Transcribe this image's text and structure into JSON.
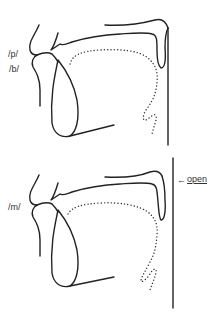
{
  "figure": {
    "type": "vocal tract sagittal sections",
    "panels": [
      {
        "id": "bilabial-oral",
        "labels": [
          "/p/",
          "/b/"
        ],
        "velum_state": "closed"
      },
      {
        "id": "bilabial-nasal",
        "labels": [
          "/m/"
        ],
        "velum_state": "open",
        "annotation": {
          "arrow": "←",
          "text": "open"
        }
      }
    ]
  },
  "colors": {
    "line": "#222222",
    "background": "#ffffff"
  }
}
